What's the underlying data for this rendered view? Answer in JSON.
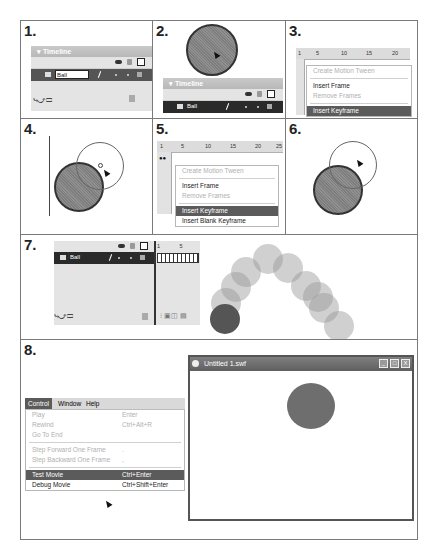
{
  "steps": [
    {
      "number": "1.",
      "timeline": {
        "title": "Timeline",
        "layer_name": "Ball"
      }
    },
    {
      "number": "2.",
      "timeline": {
        "title": "Timeline",
        "layer_name": "Ball"
      }
    },
    {
      "number": "3.",
      "ruler": [
        "1",
        "5",
        "10",
        "15",
        "20"
      ],
      "context_menu": [
        {
          "label": "Create Motion Tween",
          "state": "disabled"
        },
        {
          "label": "Insert Frame",
          "state": "enabled"
        },
        {
          "label": "Remove Frames",
          "state": "disabled"
        },
        {
          "label": "Insert Keyframe",
          "state": "selected"
        }
      ]
    },
    {
      "number": "4."
    },
    {
      "number": "5.",
      "ruler": [
        "1",
        "5",
        "10",
        "15",
        "20",
        "25"
      ],
      "context_menu": [
        {
          "label": "Create Motion Tween",
          "state": "disabled"
        },
        {
          "label": "Insert Frame",
          "state": "enabled"
        },
        {
          "label": "Remove Frames",
          "state": "disabled"
        },
        {
          "label": "Insert Keyframe",
          "state": "selected"
        },
        {
          "label": "Insert Blank Keyframe",
          "state": "enabled"
        }
      ]
    },
    {
      "number": "6."
    },
    {
      "number": "7.",
      "timeline": {
        "layer_name": "Ball",
        "ruler": [
          "1",
          "5"
        ]
      }
    },
    {
      "number": "8.",
      "menubar": [
        "Control",
        "Window",
        "Help"
      ],
      "control_menu": [
        {
          "label": "Play",
          "shortcut": "Enter",
          "state": "disabled"
        },
        {
          "label": "Rewind",
          "shortcut": "Ctrl+Alt+R",
          "state": "disabled"
        },
        {
          "label": "Go To End",
          "shortcut": "",
          "state": "disabled"
        },
        {
          "label": "Step Forward One Frame",
          "shortcut": ".",
          "state": "disabled"
        },
        {
          "label": "Step Backward One Frame",
          "shortcut": ",",
          "state": "disabled"
        },
        {
          "label": "Test Movie",
          "shortcut": "Ctrl+Enter",
          "state": "selected"
        },
        {
          "label": "Debug Movie",
          "shortcut": "Ctrl+Shift+Enter",
          "state": "enabled"
        }
      ],
      "swf_window": {
        "title": "Untitled 1.swf",
        "buttons": [
          "_",
          "□",
          "X"
        ]
      }
    }
  ],
  "colors": {
    "border": "#7a7a7a",
    "ball": "#858585",
    "menu_selected": "#5b5b5b",
    "timeline_row": "#2a2a2a"
  }
}
